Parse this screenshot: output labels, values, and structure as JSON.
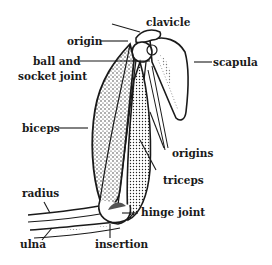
{
  "diagram": {
    "labels": {
      "clavicle": "clavicle",
      "origin": "origin",
      "ball_and_socket_line1": "ball and",
      "ball_and_socket_line2": "socket joint",
      "scapula": "scapula",
      "biceps": "biceps",
      "origins": "origins",
      "triceps": "triceps",
      "radius": "radius",
      "hinge_joint": "hinge joint",
      "ulna": "ulna",
      "insertion": "insertion"
    },
    "colors": {
      "ink": "#1a1a1a",
      "background": "#ffffff"
    }
  }
}
